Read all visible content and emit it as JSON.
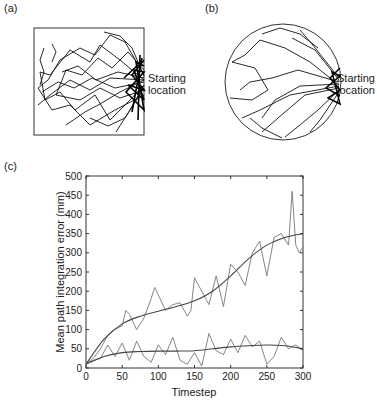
{
  "panels": {
    "a": {
      "label": "(a)",
      "annotation_line1": "Starting",
      "annotation_line2": "location",
      "shape": "square"
    },
    "b": {
      "label": "(b)",
      "annotation_line1": "Starting",
      "annotation_line2": "location",
      "shape": "circle"
    },
    "c": {
      "label": "(c)"
    }
  },
  "chart_data": [
    {
      "panel": "(a)",
      "type": "diagram",
      "title": "",
      "description": "Trajectories in square arena, converging on starting location at right edge",
      "annotation": "Starting location"
    },
    {
      "panel": "(b)",
      "type": "diagram",
      "title": "",
      "description": "Trajectories in circular arena, converging on starting location at right edge",
      "annotation": "Starting location"
    },
    {
      "panel": "(c)",
      "type": "line",
      "title": "",
      "xlabel": "Timestep",
      "ylabel": "Mean path integration error (mm)",
      "xlim": [
        0,
        300
      ],
      "ylim": [
        0,
        500
      ],
      "xticks": [
        0,
        50,
        100,
        150,
        200,
        250,
        300
      ],
      "yticks": [
        0,
        50,
        100,
        150,
        200,
        250,
        300,
        350,
        400,
        450,
        500
      ],
      "grid": false,
      "legend": null,
      "series": [
        {
          "name": "upper noisy",
          "x": [
            0,
            10,
            20,
            30,
            40,
            50,
            55,
            60,
            70,
            80,
            90,
            95,
            100,
            110,
            120,
            130,
            140,
            145,
            150,
            160,
            170,
            180,
            190,
            200,
            210,
            220,
            230,
            240,
            250,
            260,
            270,
            280,
            285,
            290,
            295,
            300
          ],
          "values": [
            10,
            25,
            50,
            85,
            100,
            110,
            150,
            140,
            100,
            130,
            180,
            210,
            190,
            150,
            165,
            170,
            135,
            150,
            235,
            200,
            165,
            240,
            160,
            270,
            250,
            215,
            300,
            330,
            240,
            340,
            350,
            320,
            460,
            320,
            300,
            315
          ]
        },
        {
          "name": "upper fit",
          "x": [
            0,
            25,
            50,
            75,
            100,
            125,
            150,
            175,
            200,
            225,
            250,
            275,
            300
          ],
          "values": [
            10,
            75,
            115,
            135,
            148,
            160,
            175,
            200,
            240,
            285,
            320,
            340,
            350
          ]
        },
        {
          "name": "lower noisy",
          "x": [
            0,
            10,
            20,
            30,
            40,
            50,
            60,
            70,
            80,
            90,
            100,
            110,
            120,
            130,
            140,
            150,
            160,
            170,
            180,
            190,
            200,
            210,
            220,
            230,
            240,
            250,
            260,
            270,
            280,
            290,
            300
          ],
          "values": [
            10,
            20,
            25,
            60,
            30,
            65,
            20,
            70,
            30,
            15,
            60,
            35,
            80,
            20,
            10,
            40,
            5,
            90,
            45,
            35,
            75,
            40,
            85,
            55,
            70,
            10,
            30,
            80,
            50,
            60,
            45
          ]
        },
        {
          "name": "lower fit",
          "x": [
            0,
            25,
            50,
            75,
            100,
            125,
            150,
            175,
            200,
            225,
            250,
            275,
            300
          ],
          "values": [
            10,
            30,
            40,
            43,
            44,
            44,
            45,
            50,
            55,
            58,
            60,
            58,
            50
          ]
        }
      ]
    }
  ]
}
